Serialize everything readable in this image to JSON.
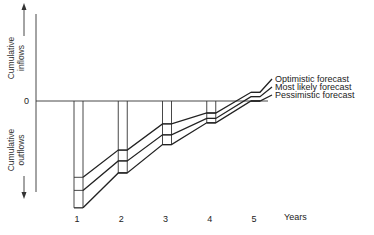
{
  "chart_data": {
    "type": "line",
    "title": "",
    "xlabel": "Years",
    "ylabel_upper": "Cumulative inflows",
    "ylabel_lower": "Cumulative outflows",
    "zero_label": "0",
    "x": [
      1,
      2,
      3,
      4,
      5
    ],
    "x_tick_labels": [
      "1",
      "2",
      "3",
      "4",
      "5"
    ],
    "ylim": [
      -100,
      100
    ],
    "series": [
      {
        "name": "Optimistic forecast",
        "values": [
          -70,
          -45,
          -21,
          -11,
          8
        ]
      },
      {
        "name": "Most likely forecast",
        "values": [
          -82,
          -55,
          -31,
          -16,
          4
        ]
      },
      {
        "name": "Pessimistic forecast",
        "values": [
          -98,
          -66,
          -40,
          -20,
          0
        ]
      }
    ],
    "grid": false,
    "legend": "right, inline at line ends"
  }
}
